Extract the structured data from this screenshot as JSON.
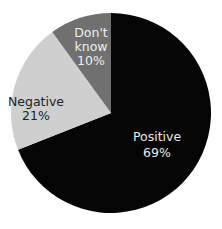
{
  "chart_data": {
    "type": "pie",
    "title": "",
    "categories": [
      "Positive",
      "Negative",
      "Don't know"
    ],
    "values": [
      69,
      21,
      10
    ],
    "unit": "%",
    "start_angle": "12 o'clock",
    "direction": "clockwise",
    "legend": "none (labels inside slices)",
    "slices": [
      {
        "label": "Positive",
        "value": 69,
        "value_label": "69%",
        "color": "#050505",
        "text_color": "#e8e8e8"
      },
      {
        "label": "Negative",
        "value": 21,
        "value_label": "21%",
        "color": "#cfcfcf",
        "text_color": "#222222"
      },
      {
        "label": "Don't know",
        "label_lines": [
          "Don't",
          "know"
        ],
        "value": 10,
        "value_label": "10%",
        "color": "#707070",
        "text_color": "#eeeeee"
      }
    ]
  }
}
